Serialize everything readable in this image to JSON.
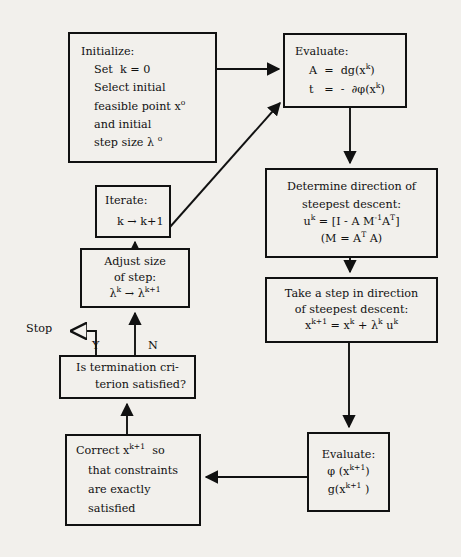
{
  "diagram": {
    "background_color": "#f2f0ec",
    "line_color": "#111111"
  },
  "nodes": {
    "initialize": {
      "line1": "Initialize:",
      "line2": "Set  k = 0",
      "line3": "Select initial",
      "line4a": "feasible point x",
      "line4b": "o",
      "line5": "and initial",
      "line6a": "step size λ ",
      "line6b": "o"
    },
    "evaluate1": {
      "line1": "Evaluate:",
      "line2a": "A  =  dg(x",
      "line2b": "k",
      "line2c": ")",
      "line3a": "t   =  -  ∂φ(x",
      "line3b": "k",
      "line3c": ")"
    },
    "determine": {
      "line1": "Determine direction of",
      "line2": "steepest descent:",
      "line3a": "u",
      "line3b": "k",
      "line3c": " = [I - A M",
      "line3d": "-1",
      "line3e": "A",
      "line3f": "T",
      "line3g": "]",
      "line4a": "(M = A",
      "line4b": "T",
      "line4c": " A)"
    },
    "takestep": {
      "line1": "Take a step in direction",
      "line2": "of steepest descent:",
      "line3a": "x",
      "line3b": "k+1",
      "line3c": " = x",
      "line3d": "k",
      "line3e": " + λ",
      "line3f": "k",
      "line3g": " u",
      "line3h": "k"
    },
    "evaluate2": {
      "line1": "Evaluate:",
      "line2a": "φ (x",
      "line2b": "k+1",
      "line2c": ")",
      "line3a": "g(x",
      "line3b": "k+1",
      "line3c": " )"
    },
    "correct": {
      "line1a": "Correct x",
      "line1b": "k+1",
      "line1c": "  so",
      "line2": "that constraints",
      "line3": "are exactly",
      "line4": "satisfied"
    },
    "decision": {
      "line1": "Is termination cri-",
      "line2": "terion satisfied?"
    },
    "iterate": {
      "line1": "Iterate:",
      "line2": "k → k+1"
    },
    "adjust": {
      "line1": "Adjust size",
      "line2": "of step:",
      "line3a": "λ",
      "line3b": "k",
      "line3c": " → λ",
      "line3d": "k+1"
    }
  },
  "labels": {
    "stop": "Stop",
    "yes_branch": "Y",
    "no_branch": "N"
  },
  "edges": [
    {
      "name": "initialize-to-evaluate1",
      "from": "initialize",
      "to": "evaluate1"
    },
    {
      "name": "evaluate1-to-determine",
      "from": "evaluate1",
      "to": "determine"
    },
    {
      "name": "determine-to-takestep",
      "from": "determine",
      "to": "takestep"
    },
    {
      "name": "takestep-to-evaluate2",
      "from": "takestep",
      "to": "evaluate2"
    },
    {
      "name": "evaluate2-to-correct",
      "from": "evaluate2",
      "to": "correct"
    },
    {
      "name": "correct-to-decision",
      "from": "correct",
      "to": "decision"
    },
    {
      "name": "decision-no-to-adjust",
      "from": "decision",
      "to": "adjust",
      "label": "N"
    },
    {
      "name": "decision-yes-to-stop",
      "from": "decision",
      "to": "stop",
      "label": "Y"
    },
    {
      "name": "adjust-to-iterate",
      "from": "adjust",
      "to": "iterate"
    },
    {
      "name": "iterate-to-evaluate1",
      "from": "iterate",
      "to": "evaluate1"
    }
  ]
}
